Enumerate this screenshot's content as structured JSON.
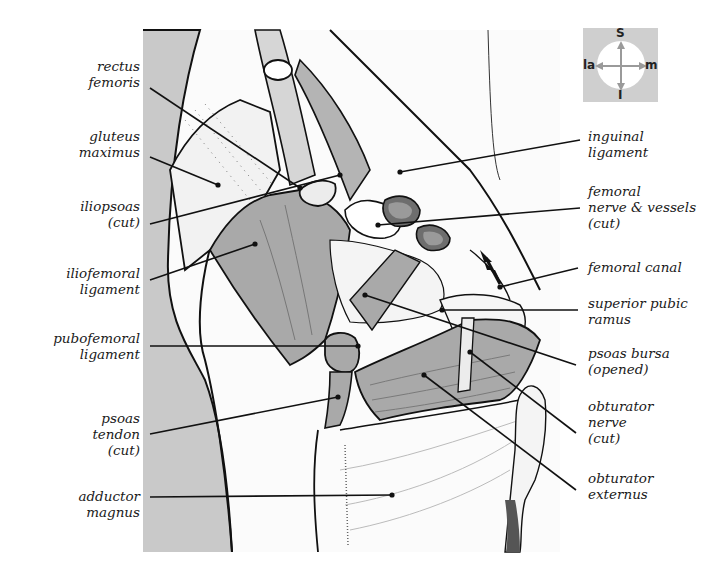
{
  "figure": {
    "compass": {
      "superior": "S",
      "inferior": "I",
      "lateral": "la",
      "medial": "m"
    },
    "labels_left": [
      {
        "id": "rectus-femoris",
        "text": "rectus\nfemoris",
        "x": 140,
        "y": 58,
        "anchor": [
          150,
          88
        ],
        "target": [
          300,
          188
        ]
      },
      {
        "id": "gluteus-maximus",
        "text": "gluteus\nmaximus",
        "x": 140,
        "y": 128,
        "anchor": [
          150,
          157
        ],
        "target": [
          218,
          185
        ]
      },
      {
        "id": "iliopsoas-cut",
        "text": "iliopsoas\n(cut)",
        "x": 140,
        "y": 198,
        "anchor": [
          150,
          224
        ],
        "target": [
          340,
          175
        ]
      },
      {
        "id": "iliofemoral-ligament",
        "text": "iliofemoral\nligament",
        "x": 140,
        "y": 265,
        "anchor": [
          150,
          280
        ],
        "target": [
          255,
          244
        ]
      },
      {
        "id": "pubofemoral-ligament",
        "text": "pubofemoral\nligament",
        "x": 140,
        "y": 330,
        "anchor": [
          150,
          346
        ],
        "target": [
          358,
          346
        ]
      },
      {
        "id": "psoas-tendon-cut",
        "text": "psoas\ntendon\n(cut)",
        "x": 140,
        "y": 410,
        "anchor": [
          150,
          434
        ],
        "target": [
          338,
          397
        ]
      },
      {
        "id": "adductor-magnus",
        "text": "adductor\nmagnus",
        "x": 140,
        "y": 488,
        "anchor": [
          150,
          497
        ],
        "target": [
          392,
          495
        ]
      }
    ],
    "labels_right": [
      {
        "id": "inguinal-ligament",
        "text": "inguinal\nligament",
        "x": 588,
        "y": 128,
        "anchor": [
          580,
          140
        ],
        "target": [
          400,
          172
        ]
      },
      {
        "id": "femoral-nerve-vessels-cut",
        "text": "femoral\nnerve & vessels\n(cut)",
        "x": 588,
        "y": 183,
        "anchor": [
          580,
          208
        ],
        "target": [
          378,
          225
        ]
      },
      {
        "id": "femoral-canal",
        "text": "femoral canal",
        "x": 588,
        "y": 259,
        "anchor": [
          578,
          268
        ],
        "target": [
          500,
          287
        ]
      },
      {
        "id": "superior-pubic-ramus",
        "text": "superior pubic\nramus",
        "x": 588,
        "y": 295,
        "anchor": [
          578,
          310
        ],
        "target": [
          442,
          310
        ]
      },
      {
        "id": "psoas-bursa-opened",
        "text": "psoas bursa\n(opened)",
        "x": 588,
        "y": 345,
        "anchor": [
          576,
          365
        ],
        "target": [
          365,
          295
        ]
      },
      {
        "id": "obturator-nerve-cut",
        "text": "obturator\nnerve\n(cut)",
        "x": 588,
        "y": 398,
        "anchor": [
          576,
          433
        ],
        "target": [
          470,
          352
        ]
      },
      {
        "id": "obturator-externus",
        "text": "obturator\nexternus",
        "x": 588,
        "y": 470,
        "anchor": [
          576,
          490
        ],
        "target": [
          424,
          375
        ]
      }
    ]
  },
  "colors": {
    "background": "#ffffff",
    "bone_grey": "#c9c9c9",
    "muscle_grey": "#a9a9a9",
    "dark_vessel": "#6e6e6e",
    "ink": "#111111",
    "compass_bg": "#cfcfcf"
  }
}
